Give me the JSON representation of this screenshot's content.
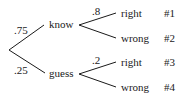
{
  "tree": {
    "root": {
      "branches": [
        {
          "label": "know",
          "probability": ".75",
          "children": [
            {
              "label": "right",
              "probability": ".8",
              "outcome": "#1"
            },
            {
              "label": "wrong",
              "probability": "",
              "outcome": "#2"
            }
          ]
        },
        {
          "label": "guess",
          "probability": ".25",
          "children": [
            {
              "label": "right",
              "probability": ".2",
              "outcome": "#3"
            },
            {
              "label": "wrong",
              "probability": "",
              "outcome": "#4"
            }
          ]
        }
      ]
    }
  }
}
